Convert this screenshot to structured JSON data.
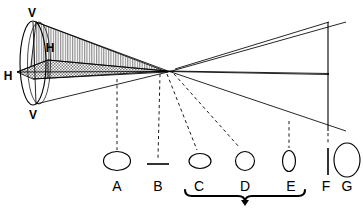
{
  "figure": {
    "background_color": "#ffffff",
    "stroke_color": "#000000",
    "vertical_hatch_color": "#9a9a9a",
    "cross_hatch_color": "#8d8d8d"
  },
  "meridian_labels": {
    "v_top": "V",
    "v_bottom": "V",
    "h_left": "H",
    "h_inner": "H"
  },
  "sections": [
    {
      "id": "A",
      "label": "A",
      "shape": "wide-ellipse",
      "cx": 117,
      "cy": 161,
      "rx": 13.5,
      "ry": 9.5
    },
    {
      "id": "B",
      "label": "B",
      "shape": "horizontal-line",
      "cx": 158,
      "cy": 164,
      "rx": 11.0,
      "ry": 0.0
    },
    {
      "id": "C",
      "label": "C",
      "shape": "small-wide-ellipse",
      "cx": 200,
      "cy": 161,
      "rx": 11.0,
      "ry": 7.5
    },
    {
      "id": "D",
      "label": "D",
      "shape": "circle",
      "cx": 245,
      "cy": 161,
      "rx": 9.5,
      "ry": 9.5
    },
    {
      "id": "E",
      "label": "E",
      "shape": "narrow-tall-ellipse",
      "cx": 289,
      "cy": 161,
      "rx": 6.5,
      "ry": 10.5
    },
    {
      "id": "F",
      "label": "F",
      "shape": "vertical-line",
      "cx": 328,
      "cy": 161,
      "rx": 0.0,
      "ry": 13.5
    },
    {
      "id": "G",
      "label": "G",
      "shape": "tall-ellipse",
      "cx": 347,
      "cy": 160,
      "rx": 13.0,
      "ry": 17.0
    }
  ],
  "brace": {
    "from_section": "C",
    "to_section": "E",
    "left_x": 185,
    "right_x": 305,
    "y": 196,
    "tip_x": 245
  },
  "leaders": [
    {
      "to": "A",
      "x1": 117,
      "y1": 79,
      "x2": 117,
      "y2": 150
    },
    {
      "to": "B",
      "x1": 160,
      "y1": 74,
      "x2": 158,
      "y2": 158
    },
    {
      "to": "C",
      "x1": 167,
      "y1": 74,
      "x2": 197,
      "y2": 150
    },
    {
      "to": "D",
      "x1": 174,
      "y1": 74,
      "x2": 240,
      "y2": 148
    },
    {
      "to": "E",
      "x1": 289,
      "y1": 121,
      "x2": 289,
      "y2": 148
    },
    {
      "to": "F",
      "x1": 328,
      "y1": 130,
      "x2": 328,
      "y2": 145
    }
  ],
  "base_ellipse": {
    "cx": 33,
    "cy": 63,
    "rx": 13,
    "ry": 42
  }
}
